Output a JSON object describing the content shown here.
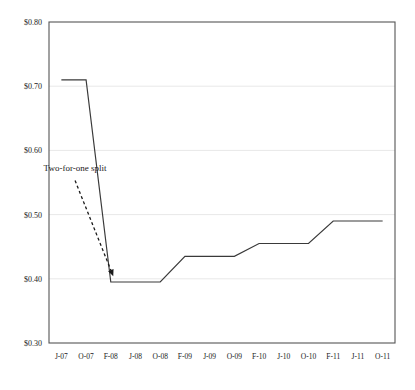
{
  "chart_data": {
    "type": "line",
    "title": "",
    "xlabel": "",
    "ylabel": "",
    "ylim": [
      0.3,
      0.8
    ],
    "ytick_values": [
      0.3,
      0.4,
      0.5,
      0.6,
      0.7,
      0.8
    ],
    "ytick_labels": [
      "$0.30",
      "$0.40",
      "$0.50",
      "$0.60",
      "$0.70",
      "$0.80"
    ],
    "grid": true,
    "grid_axis": "y",
    "legend": null,
    "categories": [
      "J-07",
      "O-07",
      "F-08",
      "J-08",
      "O-08",
      "F-09",
      "J-09",
      "O-09",
      "F-10",
      "J-10",
      "O-10",
      "F-11",
      "J-11",
      "O-11"
    ],
    "series": [
      {
        "name": "Dividend per share",
        "color": "#3a3a3a",
        "values": [
          0.71,
          0.71,
          0.395,
          0.395,
          0.395,
          0.435,
          0.435,
          0.435,
          0.455,
          0.455,
          0.455,
          0.49,
          0.49,
          0.49
        ]
      }
    ],
    "annotations": [
      {
        "text": "Two-for-one split",
        "text_x": 0.555,
        "text_y": 0.568,
        "arrow_from_x": 0.555,
        "arrow_from_y": 0.553,
        "arrow_to_x": 2.1,
        "arrow_to_y": 0.404,
        "style": "dashed-arrow"
      }
    ]
  },
  "axes": {
    "x_axis_name": "date-axis",
    "y_axis_name": "price-axis"
  },
  "colors": {
    "line": "#3a3a3a",
    "axis": "#555555",
    "grid": "#e8e8e8",
    "text": "#1a1a1a",
    "background": "#ffffff"
  }
}
